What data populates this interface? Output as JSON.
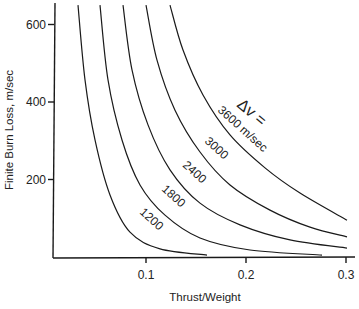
{
  "chart_data": {
    "type": "line",
    "title": "",
    "xlabel": "Thrust/Weight",
    "ylabel": "Finite Burn Loss, m/sec",
    "xlim": [
      0,
      0.3
    ],
    "ylim": [
      0,
      650
    ],
    "xticks": [
      0.1,
      0.2,
      0.3
    ],
    "xtick_labels": [
      "0.1",
      "0.2",
      "0.3"
    ],
    "yticks": [
      200,
      400,
      600
    ],
    "ytick_labels": [
      "200",
      "400",
      "600"
    ],
    "grid": false,
    "legend": null,
    "annotation": "Δv =",
    "series": [
      {
        "name": "1200",
        "label": "1200",
        "x": [
          0.032,
          0.039,
          0.049,
          0.064,
          0.084,
          0.114,
          0.161
        ],
        "y": [
          650,
          457,
          302,
          160,
          64,
          21,
          5
        ]
      },
      {
        "name": "1800",
        "label": "1800",
        "x": [
          0.054,
          0.062,
          0.076,
          0.094,
          0.119,
          0.154,
          0.204,
          0.276
        ],
        "y": [
          650,
          457,
          302,
          186,
          108,
          49,
          18,
          5
        ]
      },
      {
        "name": "2400",
        "label": "2400",
        "x": [
          0.077,
          0.086,
          0.102,
          0.124,
          0.154,
          0.194,
          0.244,
          0.301
        ],
        "y": [
          650,
          483,
          341,
          225,
          139,
          83,
          44,
          23
        ]
      },
      {
        "name": "3000",
        "label": "3000",
        "x": [
          0.1,
          0.111,
          0.129,
          0.154,
          0.184,
          0.224,
          0.264,
          0.301
        ],
        "y": [
          650,
          508,
          379,
          271,
          186,
          121,
          77,
          52
        ]
      },
      {
        "name": "3600",
        "label": "3600 m/sec",
        "x": [
          0.124,
          0.137,
          0.157,
          0.184,
          0.219,
          0.254,
          0.301
        ],
        "y": [
          650,
          534,
          418,
          315,
          230,
          165,
          95
        ]
      }
    ]
  },
  "labels": {
    "dv": "Δv =",
    "c3600": "3600 m/sec",
    "c3000": "3000",
    "c2400": "2400",
    "c1800": "1800",
    "c1200": "1200"
  }
}
